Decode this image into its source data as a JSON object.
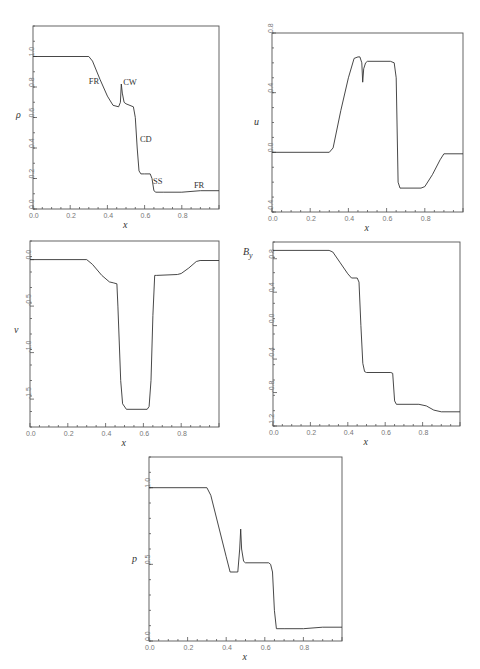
{
  "chart_data": [
    {
      "type": "line",
      "id": "rho",
      "ylabel": "ρ",
      "xlabel": "x",
      "xlim": [
        0.0,
        1.0
      ],
      "ylim": [
        0.0,
        1.2
      ],
      "xticks": [
        "0.0",
        "0.2",
        "0.4",
        "0.6",
        "0.8"
      ],
      "yticks": [
        "0.0",
        "0.2",
        "0.4",
        "0.6",
        "0.8",
        "1.0"
      ],
      "annotations": [
        {
          "text": "FR",
          "x": 0.3,
          "y": 0.82
        },
        {
          "text": "CW",
          "x": 0.485,
          "y": 0.81
        },
        {
          "text": "CD",
          "x": 0.575,
          "y": 0.44
        },
        {
          "text": "SS",
          "x": 0.645,
          "y": 0.165
        },
        {
          "text": "FR",
          "x": 0.865,
          "y": 0.135
        }
      ],
      "x": [
        0.0,
        0.3,
        0.32,
        0.36,
        0.4,
        0.43,
        0.46,
        0.47,
        0.475,
        0.48,
        0.49,
        0.5,
        0.54,
        0.55,
        0.56,
        0.57,
        0.58,
        0.6,
        0.63,
        0.64,
        0.65,
        0.66,
        0.7,
        0.8,
        0.9,
        1.0
      ],
      "y": [
        1.0,
        1.0,
        0.97,
        0.85,
        0.74,
        0.68,
        0.67,
        0.7,
        0.82,
        0.76,
        0.7,
        0.69,
        0.67,
        0.6,
        0.4,
        0.25,
        0.23,
        0.23,
        0.23,
        0.2,
        0.12,
        0.11,
        0.11,
        0.11,
        0.12,
        0.12
      ]
    },
    {
      "type": "line",
      "id": "u",
      "ylabel": "u",
      "xlabel": "x",
      "xlim": [
        0.0,
        1.0
      ],
      "ylim": [
        -0.4,
        0.8
      ],
      "xticks": [
        "0.0",
        "0.2",
        "0.4",
        "0.6",
        "0.8"
      ],
      "yticks": [
        "-0.4",
        "0.0",
        "0.4",
        "0.8"
      ],
      "x": [
        0.0,
        0.3,
        0.32,
        0.36,
        0.4,
        0.43,
        0.45,
        0.46,
        0.47,
        0.475,
        0.48,
        0.49,
        0.5,
        0.62,
        0.64,
        0.65,
        0.66,
        0.67,
        0.78,
        0.8,
        0.84,
        0.88,
        0.9,
        1.0
      ],
      "y": [
        0.0,
        0.0,
        0.03,
        0.28,
        0.5,
        0.63,
        0.64,
        0.64,
        0.6,
        0.47,
        0.56,
        0.6,
        0.61,
        0.61,
        0.6,
        0.5,
        -0.2,
        -0.24,
        -0.24,
        -0.23,
        -0.15,
        -0.05,
        -0.01,
        -0.01
      ]
    },
    {
      "type": "line",
      "id": "v",
      "ylabel": "v",
      "xlabel": "x",
      "xlim": [
        0.0,
        1.0
      ],
      "ylim": [
        -1.8,
        0.2
      ],
      "xticks": [
        "0.0",
        "0.2",
        "0.4",
        "0.6",
        "0.8"
      ],
      "yticks": [
        "-1.5",
        "-1.0",
        "-0.5",
        "0.0"
      ],
      "x": [
        0.0,
        0.3,
        0.33,
        0.38,
        0.42,
        0.44,
        0.46,
        0.465,
        0.48,
        0.49,
        0.51,
        0.62,
        0.63,
        0.64,
        0.65,
        0.66,
        0.67,
        0.78,
        0.8,
        0.84,
        0.88,
        0.9,
        1.0
      ],
      "y": [
        0.0,
        0.0,
        -0.05,
        -0.17,
        -0.24,
        -0.25,
        -0.26,
        -0.5,
        -1.3,
        -1.55,
        -1.61,
        -1.61,
        -1.58,
        -1.3,
        -0.6,
        -0.17,
        -0.17,
        -0.16,
        -0.15,
        -0.09,
        -0.02,
        -0.01,
        -0.01
      ]
    },
    {
      "type": "line",
      "id": "By",
      "ylabel": "B_y",
      "xlabel": "x",
      "xlim": [
        0.0,
        1.0
      ],
      "ylim": [
        -1.2,
        1.0
      ],
      "xticks": [
        "0.0",
        "0.2",
        "0.4",
        "0.6",
        "0.8"
      ],
      "yticks": [
        "-1.2",
        "-0.8",
        "-0.4",
        "-0.0",
        "0.4",
        "0.8"
      ],
      "x": [
        0.0,
        0.3,
        0.32,
        0.36,
        0.4,
        0.42,
        0.45,
        0.46,
        0.47,
        0.48,
        0.49,
        0.5,
        0.63,
        0.64,
        0.65,
        0.66,
        0.78,
        0.82,
        0.86,
        0.9,
        1.0
      ],
      "y": [
        0.9,
        0.9,
        0.88,
        0.75,
        0.62,
        0.57,
        0.57,
        0.52,
        0.0,
        -0.45,
        -0.55,
        -0.56,
        -0.56,
        -0.57,
        -0.9,
        -0.94,
        -0.94,
        -0.96,
        -1.01,
        -1.03,
        -1.03
      ]
    },
    {
      "type": "line",
      "id": "p",
      "ylabel": "p",
      "xlabel": "x",
      "xlim": [
        0.0,
        1.0
      ],
      "ylim": [
        0.0,
        1.2
      ],
      "xticks": [
        "0.0",
        "0.2",
        "0.4",
        "0.6",
        "0.8"
      ],
      "yticks": [
        "0.0",
        "0.5",
        "1.0"
      ],
      "x": [
        0.0,
        0.3,
        0.32,
        0.36,
        0.4,
        0.42,
        0.45,
        0.46,
        0.47,
        0.475,
        0.48,
        0.49,
        0.5,
        0.62,
        0.63,
        0.64,
        0.65,
        0.66,
        0.7,
        0.8,
        0.9,
        1.0
      ],
      "y": [
        1.0,
        1.0,
        0.95,
        0.75,
        0.55,
        0.45,
        0.45,
        0.45,
        0.6,
        0.73,
        0.6,
        0.52,
        0.51,
        0.51,
        0.5,
        0.45,
        0.2,
        0.08,
        0.08,
        0.08,
        0.09,
        0.09
      ]
    }
  ],
  "plots": {
    "rho": {
      "ylabel": "ρ",
      "xlabel": "x"
    },
    "u": {
      "ylabel": "u",
      "xlabel": "x"
    },
    "v": {
      "ylabel": "v",
      "xlabel": "x"
    },
    "By": {
      "ylabel_main": "B",
      "ylabel_sub": "y",
      "xlabel": "x"
    },
    "p": {
      "ylabel": "p",
      "xlabel": "x"
    }
  }
}
